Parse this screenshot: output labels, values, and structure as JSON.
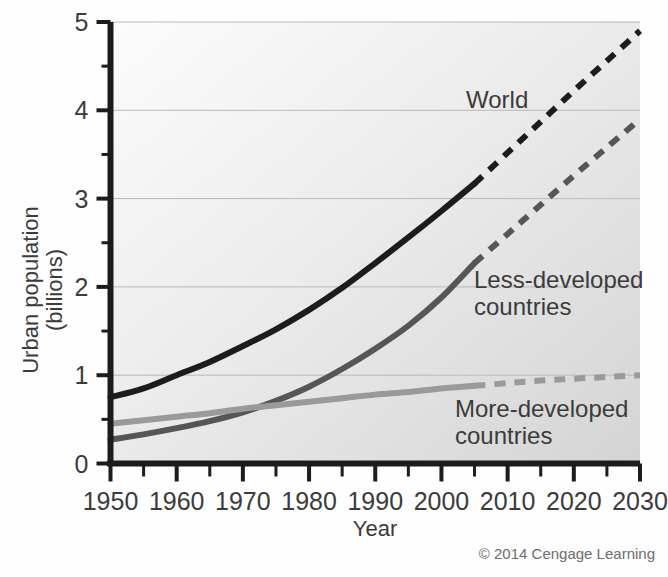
{
  "figure": {
    "credit": "© 2014 Cengage Learning",
    "background_color": "#fefefe",
    "plot_fill_from": "#fcfcfc",
    "plot_fill_to": "#d8d8d8"
  },
  "axes": {
    "x_title": "Year",
    "y_title_line1": "Urban population",
    "y_title_line2": "(billions)",
    "x_tick_labels": [
      "1950",
      "1960",
      "1970",
      "1980",
      "1990",
      "2000",
      "2010",
      "2020",
      "2030"
    ],
    "y_tick_labels": [
      "0",
      "1",
      "2",
      "3",
      "4",
      "5"
    ]
  },
  "labels": {
    "world": "World",
    "less_developed_line1": "Less-developed",
    "less_developed_line2": "countries",
    "more_developed_line1": "More-developed",
    "more_developed_line2": "countries"
  },
  "chart_data": {
    "type": "line",
    "title": "",
    "subtitle": "",
    "xlabel": "Year",
    "ylabel": "Urban population (billions)",
    "xlim": [
      1950,
      2030
    ],
    "ylim": [
      0,
      5
    ],
    "x_ticks_major": [
      1950,
      1960,
      1970,
      1980,
      1990,
      2000,
      2010,
      2020,
      2030
    ],
    "x_ticks_minor": [
      1955,
      1965,
      1975,
      1985,
      1995,
      2005,
      2015,
      2025
    ],
    "y_ticks_major": [
      0,
      1,
      2,
      3,
      4,
      5
    ],
    "y_ticks_minor": [
      0.5,
      1.5,
      2.5,
      3.5,
      4.5
    ],
    "grid": "horizontal",
    "legend_position": "inline-annotations",
    "projection_starts_year": 2005,
    "annotations": [
      {
        "text": "World",
        "x": 2002,
        "y": 4.1
      },
      {
        "text": "Less-developed countries",
        "x": 2008,
        "y": 2.45
      },
      {
        "text": "More-developed countries",
        "x": 2006,
        "y": 0.62
      },
      {
        "text": "© 2014 Cengage Learning",
        "x": 2026,
        "y": -0.75
      }
    ],
    "x": [
      1950,
      1955,
      1960,
      1965,
      1970,
      1975,
      1980,
      1985,
      1990,
      1995,
      2000,
      2005,
      2010,
      2015,
      2020,
      2025,
      2030
    ],
    "series": [
      {
        "name": "World",
        "color": "#1c1c1c",
        "solid_through": 2005,
        "values": [
          0.75,
          0.85,
          1.0,
          1.15,
          1.33,
          1.52,
          1.74,
          1.99,
          2.27,
          2.56,
          2.86,
          3.17,
          3.52,
          3.87,
          4.22,
          4.56,
          4.9
        ]
      },
      {
        "name": "Less-developed countries",
        "color": "#565656",
        "solid_through": 2005,
        "values": [
          0.27,
          0.33,
          0.4,
          0.48,
          0.58,
          0.71,
          0.87,
          1.07,
          1.3,
          1.56,
          1.88,
          2.27,
          2.6,
          2.93,
          3.26,
          3.58,
          3.9
        ]
      },
      {
        "name": "More-developed countries",
        "color": "#9a9a9a",
        "solid_through": 2005,
        "values": [
          0.45,
          0.49,
          0.53,
          0.57,
          0.62,
          0.66,
          0.7,
          0.74,
          0.78,
          0.81,
          0.85,
          0.88,
          0.91,
          0.94,
          0.96,
          0.98,
          1.0
        ]
      }
    ]
  }
}
